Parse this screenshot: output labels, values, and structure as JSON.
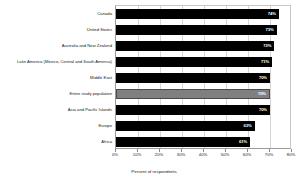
{
  "chart_data": {
    "type": "bar",
    "orientation": "horizontal",
    "title": "",
    "xlabel": "Percent of respondents",
    "ylabel": "",
    "xlim": [
      0,
      80
    ],
    "xticks": [
      "0%",
      "10%",
      "20%",
      "30%",
      "40%",
      "50%",
      "60%",
      "70%",
      "80%"
    ],
    "xtick_values": [
      0,
      10,
      20,
      30,
      40,
      50,
      60,
      70,
      80
    ],
    "grid": true,
    "legend": "none",
    "categories": [
      "Canada",
      "United States",
      "Australia and New Zealand",
      "Latin America (Mexico, Central and South America)",
      "Middle East",
      "Entire study population",
      "Asia and Pacific Islands",
      "Europe",
      "Africa"
    ],
    "values": [
      74,
      73,
      72,
      71,
      70,
      70,
      70,
      63,
      61
    ],
    "value_labels": [
      "74%",
      "73%",
      "72%",
      "71%",
      "70%",
      "70%",
      "70%",
      "63%",
      "61%"
    ],
    "highlight_index": 5,
    "colors": {
      "bar": "#000000",
      "highlight_bar": "#808080",
      "highlight_border": "#4a4a4a",
      "value_text": "#ffffff",
      "grid": "#d4d4d4",
      "axis": "#9a9a9a",
      "background": "#ffffff",
      "text": "#1a1a1a"
    }
  }
}
